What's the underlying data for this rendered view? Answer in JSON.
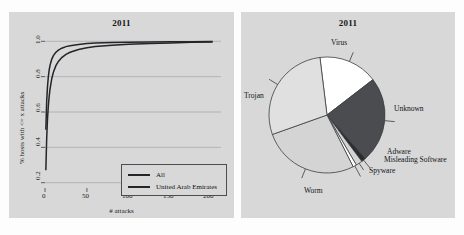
{
  "figure": {
    "background": "#fdfdfd",
    "panel_background": "#d8d8d8"
  },
  "left_panel": {
    "title": "2011",
    "xlabel": "# attacks",
    "ylabel": "% hosts with <= x attacks",
    "xticks": [
      "0",
      "50",
      "100",
      "150",
      "200"
    ],
    "yticks": [
      "0.2",
      "0.4",
      "0.6",
      "0.8",
      "1.0"
    ],
    "legend": {
      "items": [
        {
          "label": "All",
          "color": "#232528"
        },
        {
          "label": "United Arab Emirates",
          "color": "#232528"
        }
      ]
    }
  },
  "right_panel": {
    "title": "2011",
    "labels": [
      {
        "name": "Virus"
      },
      {
        "name": "Unknown"
      },
      {
        "name": "Adware"
      },
      {
        "name": "Misleading Software"
      },
      {
        "name": "Spyware"
      },
      {
        "name": "Worm"
      },
      {
        "name": "Trojan"
      }
    ]
  },
  "chart_data": [
    {
      "type": "line",
      "title": "2011",
      "xlabel": "# attacks",
      "ylabel": "% hosts with <= x attacks",
      "xlim": [
        0,
        210
      ],
      "ylim": [
        0.17,
        1.03
      ],
      "xticks": [
        0,
        50,
        100,
        150,
        200
      ],
      "yticks": [
        0.2,
        0.4,
        0.6,
        0.8,
        1.0
      ],
      "grid": "horizontal",
      "legend_position": "lower-right",
      "series": [
        {
          "name": "All",
          "color": "#232528",
          "x": [
            1,
            2,
            3,
            4,
            5,
            6,
            8,
            10,
            13,
            16,
            20,
            25,
            30,
            40,
            50,
            60,
            80,
            100,
            125,
            150,
            175,
            200
          ],
          "y": [
            0.27,
            0.45,
            0.56,
            0.635,
            0.69,
            0.73,
            0.787,
            0.825,
            0.862,
            0.886,
            0.908,
            0.926,
            0.938,
            0.954,
            0.964,
            0.97,
            0.978,
            0.983,
            0.988,
            0.991,
            0.994,
            0.996
          ]
        },
        {
          "name": "United Arab Emirates",
          "color": "#232528",
          "x": [
            1,
            2,
            3,
            4,
            5,
            6,
            8,
            10,
            13,
            16,
            20,
            25,
            30,
            40,
            50,
            60,
            80,
            100,
            125,
            150,
            175,
            200
          ],
          "y": [
            0.5,
            0.66,
            0.745,
            0.8,
            0.838,
            0.864,
            0.898,
            0.919,
            0.938,
            0.95,
            0.961,
            0.97,
            0.975,
            0.982,
            0.987,
            0.99,
            0.993,
            0.995,
            0.996,
            0.997,
            0.998,
            0.999
          ]
        }
      ]
    },
    {
      "type": "pie",
      "title": "2011",
      "labels": [
        "Virus",
        "Unknown",
        "Adware",
        "Misleading Software",
        "Spyware",
        "Worm",
        "Trojan"
      ],
      "values": [
        16.5,
        24.0,
        1.2,
        1.8,
        1.0,
        27.0,
        28.5
      ],
      "colors": [
        "#ffffff",
        "#4a4c4f",
        "#2a2c2f",
        "#d4d4d4",
        "#ffffff",
        "#d4d4d4",
        "#e0e0e0"
      ],
      "edge_color": "#3b3d40",
      "start_angle": 97,
      "direction": "clockwise"
    }
  ]
}
